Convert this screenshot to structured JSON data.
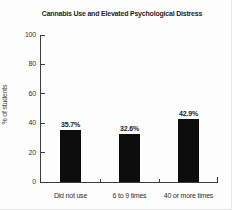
{
  "figure": {
    "background": "#fdfdfd"
  },
  "chart_data": {
    "type": "bar",
    "title": "Cannabis Use and Elevated Psychological Distress",
    "xlabel": "",
    "ylabel": "% of students",
    "categories": [
      "Did not use",
      "6 to 9 times",
      "40 or more times"
    ],
    "values": [
      35.7,
      32.6,
      42.9
    ],
    "value_labels": [
      "35.7%",
      "32.6%",
      "42.9%"
    ],
    "y_ticks": [
      "0",
      "20",
      "40",
      "60",
      "80",
      "100"
    ],
    "ylim": [
      0,
      100
    ],
    "grid": false,
    "legend": false,
    "bar_color": "#0d0d0d",
    "axis_color": "#3c3c3c",
    "text_color": "#2e2e2e"
  }
}
